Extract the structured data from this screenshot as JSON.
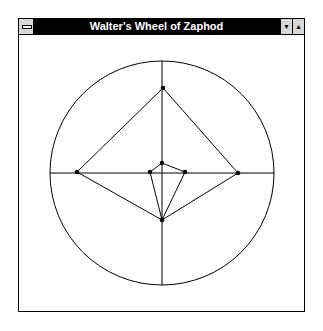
{
  "window": {
    "title": "Walter's Wheel of Zaphod",
    "system_menu_icon": "system-menu-icon",
    "minimize_icon": "triangle-down",
    "maximize_icon": "triangle-up",
    "minimize_glyph": "▼",
    "maximize_glyph": "▲"
  },
  "drawing": {
    "stroke_color": "#000000",
    "background": "#ffffff",
    "circle": {
      "cx": 162,
      "cy": 173,
      "r": 112
    },
    "axes": {
      "horizontal": {
        "x1": 50,
        "y1": 173,
        "x2": 274,
        "y2": 173
      },
      "vertical": {
        "x1": 162,
        "y1": 61,
        "x2": 162,
        "y2": 285
      }
    },
    "outer_polygon": [
      {
        "x": 163,
        "y": 88
      },
      {
        "x": 238,
        "y": 173
      },
      {
        "x": 162,
        "y": 220
      },
      {
        "x": 77,
        "y": 172
      }
    ],
    "inner_polygon": [
      {
        "x": 162,
        "y": 163
      },
      {
        "x": 185,
        "y": 172
      },
      {
        "x": 162,
        "y": 220
      },
      {
        "x": 150,
        "y": 172
      }
    ],
    "points": [
      {
        "x": 163,
        "y": 88
      },
      {
        "x": 77,
        "y": 172
      },
      {
        "x": 238,
        "y": 173
      },
      {
        "x": 162,
        "y": 163
      },
      {
        "x": 150,
        "y": 172
      },
      {
        "x": 185,
        "y": 172
      },
      {
        "x": 162,
        "y": 220
      }
    ]
  }
}
